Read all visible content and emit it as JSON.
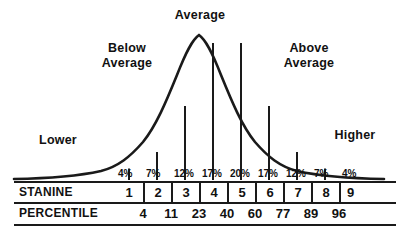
{
  "chart_data": {
    "type": "bar",
    "xlabel": "STANINE",
    "ylabel": "",
    "grid": false,
    "legend_position": "none",
    "categories": [
      "1",
      "2",
      "3",
      "4",
      "5",
      "6",
      "7",
      "8",
      "9"
    ],
    "values": [
      4,
      7,
      12,
      17,
      20,
      17,
      12,
      7,
      4
    ],
    "value_labels": [
      "4%",
      "7%",
      "12%",
      "17%",
      "20%",
      "17%",
      "12%",
      "7%",
      "4%"
    ],
    "series": [
      {
        "name": "Percent of scores",
        "values": [
          4,
          7,
          12,
          17,
          20,
          17,
          12,
          7,
          4
        ]
      }
    ],
    "percentile_boundaries": [
      4,
      11,
      23,
      40,
      60,
      77,
      89,
      96
    ],
    "annotations": [
      {
        "text": "Average",
        "region": "center",
        "stanines": [
          4,
          5,
          6
        ]
      },
      {
        "text": "Below\nAverage",
        "region": "left-mid",
        "stanines": [
          2,
          3
        ]
      },
      {
        "text": "Above\nAverage",
        "region": "right-mid",
        "stanines": [
          7,
          8
        ]
      },
      {
        "text": "Lower",
        "region": "far-left",
        "stanines": [
          1
        ]
      },
      {
        "text": "Higher",
        "region": "far-right",
        "stanines": [
          9
        ]
      }
    ],
    "curve": "normal-bell",
    "ylim": [
      0,
      20
    ]
  },
  "labels": {
    "average": "Average",
    "below_average": "Below\nAverage",
    "above_average": "Above\nAverage",
    "lower": "Lower",
    "higher": "Higher"
  },
  "rows": {
    "stanine": {
      "title": "STANINE",
      "cells": [
        "1",
        "2",
        "3",
        "4",
        "5",
        "6",
        "7",
        "8",
        "9"
      ]
    },
    "percentile": {
      "title": "PERCENTILE",
      "values": [
        "4",
        "11",
        "23",
        "40",
        "60",
        "77",
        "89",
        "96"
      ]
    },
    "percent": {
      "cells": [
        "4%",
        "7%",
        "12%",
        "17%",
        "20%",
        "17%",
        "12%",
        "7%",
        "4%"
      ]
    }
  },
  "colors": {
    "ink": "#111111",
    "rule": "#1a1a1a",
    "background": "#ffffff"
  }
}
